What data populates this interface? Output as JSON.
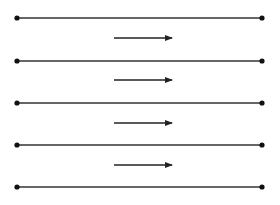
{
  "diagram": {
    "colors": {
      "line": "#333333",
      "dot": "#111111",
      "background": "#ffffff"
    },
    "lines": [
      {
        "y": 18,
        "x1": 17,
        "x2": 262
      },
      {
        "y": 61,
        "x1": 17,
        "x2": 262
      },
      {
        "y": 103,
        "x1": 17,
        "x2": 262
      },
      {
        "y": 145,
        "x1": 17,
        "x2": 262
      },
      {
        "y": 187,
        "x1": 17,
        "x2": 262
      }
    ],
    "arrows": [
      {
        "y": 38,
        "x1": 114,
        "x2": 172,
        "direction": "right"
      },
      {
        "y": 80,
        "x1": 114,
        "x2": 172,
        "direction": "right"
      },
      {
        "y": 123,
        "x1": 114,
        "x2": 172,
        "direction": "right"
      },
      {
        "y": 165,
        "x1": 114,
        "x2": 172,
        "direction": "right"
      }
    ]
  }
}
